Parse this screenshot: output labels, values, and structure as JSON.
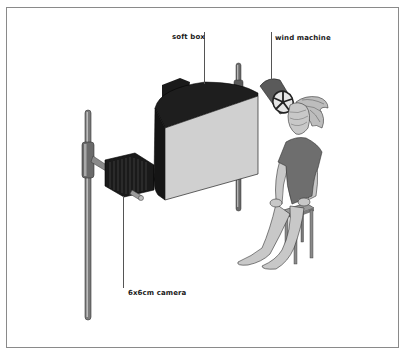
{
  "figure": {
    "type": "studio lighting setup illustration",
    "labels": {
      "soft_box": "soft box",
      "wind_machine": "wind machine",
      "camera": "6x6cm camera"
    },
    "colors": {
      "frame": "#8a8a8a",
      "softbox_front": "#d0d0d0",
      "softbox_body": "#1c1c1c",
      "stand": "#7a7a7a",
      "camera_body": "#1a1a1a",
      "wind_machine": "#5a5a5a",
      "figure_shirt": "#6e6e6e",
      "figure_skin": "#c8c8c8",
      "stool": "#8c8c8c"
    }
  }
}
